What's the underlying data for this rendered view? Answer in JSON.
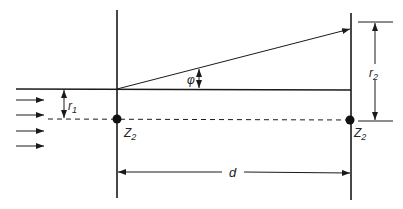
{
  "diagram": {
    "type": "geometry-schematic",
    "labels": {
      "r1": "r",
      "r1_sub": "1",
      "r2": "r",
      "r2_sub": "2",
      "phi": "φ",
      "d": "d",
      "z_left": "Z",
      "z_left_sub": "2",
      "z_right": "Z",
      "z_right_sub": "2"
    },
    "incident_arrows": 4,
    "colors": {
      "line": "#1a1a1a",
      "background": "#ffffff"
    }
  }
}
